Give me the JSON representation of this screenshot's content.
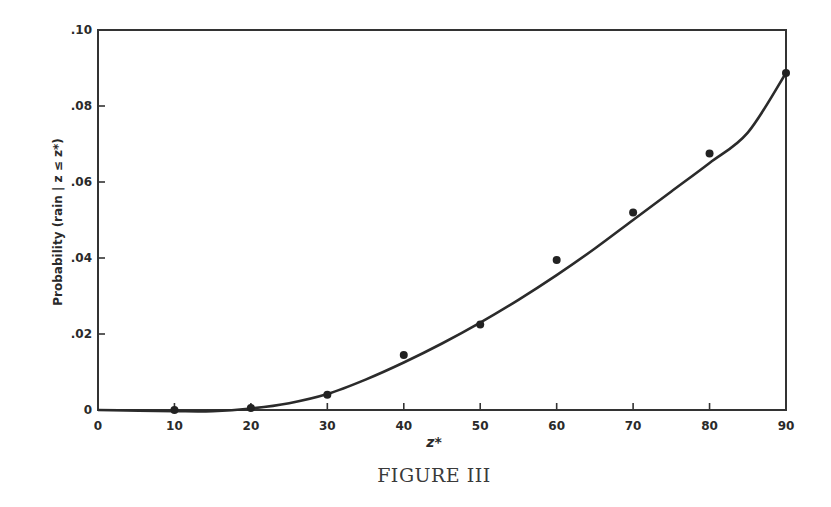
{
  "figure": {
    "caption": "FIGURE III",
    "xlabel": "z*",
    "ylabel": "Probability (rain | z ≤ z*)"
  },
  "colors": {
    "ink": "#2b2b2b",
    "background": "#ffffff"
  },
  "chart_data": {
    "type": "scatter",
    "title": "FIGURE III",
    "xlabel": "z*",
    "ylabel": "Probability (rain | z ≤ z*)",
    "xlim": [
      0,
      90
    ],
    "ylim": [
      0,
      0.1
    ],
    "x_ticks": [
      0,
      10,
      20,
      30,
      40,
      50,
      60,
      70,
      80,
      90
    ],
    "x_tick_labels": [
      "0",
      "10",
      "20",
      "30",
      "40",
      "50",
      "60",
      "70",
      "80",
      "90"
    ],
    "y_ticks": [
      0,
      0.02,
      0.04,
      0.06,
      0.08,
      0.1
    ],
    "y_tick_labels": [
      "0",
      ".02",
      ".04",
      ".06",
      ".08",
      ".10"
    ],
    "grid": false,
    "legend": null,
    "series": [
      {
        "name": "observed",
        "kind": "points",
        "x": [
          10,
          20,
          30,
          40,
          50,
          60,
          70,
          80,
          90
        ],
        "y": [
          0.0,
          0.0005,
          0.004,
          0.0145,
          0.0225,
          0.0395,
          0.052,
          0.0675,
          0.0887
        ]
      },
      {
        "name": "fitted curve",
        "kind": "line",
        "x": [
          0,
          10,
          15,
          20,
          25,
          30,
          35,
          40,
          45,
          50,
          55,
          60,
          65,
          70,
          75,
          80,
          85,
          90
        ],
        "y": [
          0.0,
          -0.0003,
          -0.0003,
          0.0004,
          0.0018,
          0.0042,
          0.008,
          0.0125,
          0.0175,
          0.023,
          0.029,
          0.0355,
          0.0425,
          0.05,
          0.0575,
          0.065,
          0.073,
          0.0887
        ]
      }
    ]
  }
}
